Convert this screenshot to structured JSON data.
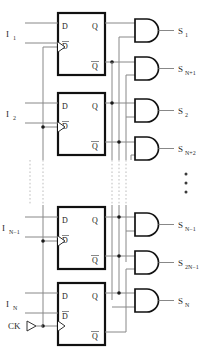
{
  "diagram": {
    "type": "schematic",
    "clock": {
      "label": "CK",
      "symbol": "input-port-triangle",
      "x": 30,
      "y": 326
    },
    "flipflops": [
      {
        "id": "ff1",
        "index": 1,
        "pins": {
          "d": "D",
          "dbar": "D̅",
          "q": "Q",
          "qbar": "Q̅",
          "clk": "clock-triangle"
        },
        "input_label": "I",
        "input_sub": "1",
        "box": {
          "x": 58,
          "y": 13,
          "w": 47,
          "h": 62
        }
      },
      {
        "id": "ff2",
        "index": 2,
        "pins": {
          "d": "D",
          "dbar": "D̅",
          "q": "Q",
          "qbar": "Q̅",
          "clk": "clock-triangle"
        },
        "input_label": "I",
        "input_sub": "2",
        "box": {
          "x": 58,
          "y": 93,
          "w": 47,
          "h": 62
        }
      },
      {
        "id": "ffN1",
        "index": 3,
        "pins": {
          "d": "D",
          "dbar": "D̅",
          "q": "Q",
          "qbar": "Q̅",
          "clk": "clock-triangle"
        },
        "input_label": "I",
        "input_sub": "N−1",
        "box": {
          "x": 58,
          "y": 207,
          "w": 47,
          "h": 62
        }
      },
      {
        "id": "ffN",
        "index": 4,
        "pins": {
          "d": "D",
          "dbar": "D̅",
          "q": "Q",
          "qbar": "Q̅",
          "clk": "clock-triangle"
        },
        "input_label": "I",
        "input_sub": "N",
        "box": {
          "x": 58,
          "y": 283,
          "w": 47,
          "h": 62
        }
      }
    ],
    "gates": [
      {
        "id": "g1",
        "type": "AND",
        "out_label": "S",
        "out_sub": "1",
        "x": 135,
        "y": 19
      },
      {
        "id": "g2",
        "type": "AND",
        "out_label": "S",
        "out_sub": "N+1",
        "x": 135,
        "y": 57
      },
      {
        "id": "g3",
        "type": "AND",
        "out_label": "S",
        "out_sub": "2",
        "x": 135,
        "y": 99
      },
      {
        "id": "g4",
        "type": "AND",
        "out_label": "S",
        "out_sub": "N+2",
        "x": 135,
        "y": 137
      },
      {
        "id": "g5",
        "type": "AND",
        "out_label": "S",
        "out_sub": "N−1",
        "x": 135,
        "y": 213
      },
      {
        "id": "g6",
        "type": "AND",
        "out_label": "S",
        "out_sub": "2N−1",
        "x": 135,
        "y": 251
      },
      {
        "id": "g7",
        "type": "AND",
        "out_label": "S",
        "out_sub": "N",
        "x": 135,
        "y": 289
      }
    ],
    "ellipses": [
      {
        "id": "vertical-dots-left",
        "orientation": "vertical",
        "x": 43,
        "y": 178
      },
      {
        "id": "vertical-dots-right",
        "orientation": "vertical",
        "x": 186,
        "y": 182
      }
    ],
    "pin_text": {
      "d": "D",
      "dbar": "D",
      "q": "Q",
      "qbar": "Q"
    }
  }
}
